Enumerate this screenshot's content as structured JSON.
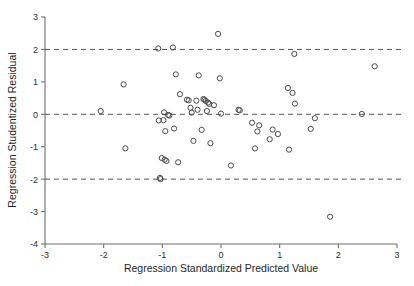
{
  "chart_data": {
    "type": "scatter",
    "title": "",
    "xlabel": "Regression Standardized Predicted Value",
    "ylabel": "Regression Studentized Residual",
    "xlim": [
      -3,
      3
    ],
    "ylim": [
      -4,
      3
    ],
    "xticks": [
      -3,
      -2,
      -1,
      0,
      1,
      2,
      3
    ],
    "yticks": [
      -4,
      -3,
      -2,
      -1,
      0,
      1,
      2,
      3
    ],
    "xtick_labels": [
      "-3",
      "-2",
      "-1",
      "0",
      "1",
      "2",
      "3"
    ],
    "ytick_labels": [
      "-4",
      "-3",
      "-2",
      "-1",
      "0",
      "1",
      "2",
      "3"
    ],
    "grid": false,
    "legend": null,
    "reference_lines": [
      {
        "axis": "y",
        "value": 2,
        "style": "dashed"
      },
      {
        "axis": "y",
        "value": 0,
        "style": "dashed"
      },
      {
        "axis": "y",
        "value": -2,
        "style": "dashed"
      }
    ],
    "marker": {
      "shape": "open-circle",
      "size": 4,
      "color": "#4a4a4a"
    },
    "points": [
      {
        "x": -2.05,
        "y": 0.1
      },
      {
        "x": -1.66,
        "y": 0.92
      },
      {
        "x": -1.63,
        "y": -1.05
      },
      {
        "x": -1.07,
        "y": 2.03
      },
      {
        "x": -1.06,
        "y": -0.19
      },
      {
        "x": -1.04,
        "y": -1.96
      },
      {
        "x": -1.03,
        "y": -2.0
      },
      {
        "x": -1.01,
        "y": -1.35
      },
      {
        "x": -0.98,
        "y": -0.18
      },
      {
        "x": -0.97,
        "y": 0.06
      },
      {
        "x": -0.96,
        "y": -1.4
      },
      {
        "x": -0.95,
        "y": -0.52
      },
      {
        "x": -0.93,
        "y": -1.44
      },
      {
        "x": -0.9,
        "y": -0.02
      },
      {
        "x": -0.88,
        "y": -0.04
      },
      {
        "x": -0.82,
        "y": 2.06
      },
      {
        "x": -0.8,
        "y": -0.44
      },
      {
        "x": -0.77,
        "y": 1.23
      },
      {
        "x": -0.73,
        "y": -1.48
      },
      {
        "x": -0.7,
        "y": 0.62
      },
      {
        "x": -0.58,
        "y": 0.45
      },
      {
        "x": -0.55,
        "y": 0.43
      },
      {
        "x": -0.52,
        "y": 0.2
      },
      {
        "x": -0.5,
        "y": 0.05
      },
      {
        "x": -0.47,
        "y": -0.82
      },
      {
        "x": -0.42,
        "y": 0.42
      },
      {
        "x": -0.4,
        "y": 0.14
      },
      {
        "x": -0.38,
        "y": 1.2
      },
      {
        "x": -0.33,
        "y": -0.48
      },
      {
        "x": -0.3,
        "y": 0.47
      },
      {
        "x": -0.28,
        "y": 0.45
      },
      {
        "x": -0.26,
        "y": 0.41
      },
      {
        "x": -0.24,
        "y": 0.1
      },
      {
        "x": -0.22,
        "y": 0.36
      },
      {
        "x": -0.2,
        "y": 0.32
      },
      {
        "x": -0.18,
        "y": -0.89
      },
      {
        "x": -0.12,
        "y": 0.28
      },
      {
        "x": -0.05,
        "y": 2.48
      },
      {
        "x": -0.02,
        "y": 1.11
      },
      {
        "x": 0.0,
        "y": 0.02
      },
      {
        "x": 0.17,
        "y": -1.58
      },
      {
        "x": 0.3,
        "y": 0.14
      },
      {
        "x": 0.32,
        "y": 0.12
      },
      {
        "x": 0.53,
        "y": -0.26
      },
      {
        "x": 0.58,
        "y": -1.05
      },
      {
        "x": 0.62,
        "y": -0.53
      },
      {
        "x": 0.65,
        "y": -0.34
      },
      {
        "x": 0.83,
        "y": -0.77
      },
      {
        "x": 0.88,
        "y": -0.47
      },
      {
        "x": 0.97,
        "y": -0.61
      },
      {
        "x": 1.14,
        "y": 0.81
      },
      {
        "x": 1.16,
        "y": -1.09
      },
      {
        "x": 1.22,
        "y": 0.66
      },
      {
        "x": 1.25,
        "y": 1.86
      },
      {
        "x": 1.26,
        "y": 0.33
      },
      {
        "x": 1.53,
        "y": -0.45
      },
      {
        "x": 1.6,
        "y": -0.12
      },
      {
        "x": 1.86,
        "y": -3.16
      },
      {
        "x": 2.4,
        "y": 0.01
      },
      {
        "x": 2.62,
        "y": 1.48
      }
    ]
  }
}
